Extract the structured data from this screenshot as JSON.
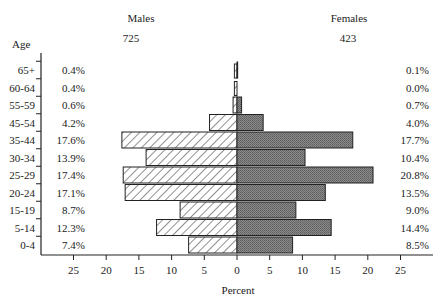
{
  "chart_data": {
    "type": "bar",
    "subtype": "population-pyramid",
    "title": "",
    "xlabel": "Percent",
    "ylabel": "Age",
    "categories": [
      "65+",
      "60-64",
      "55-59",
      "45-54",
      "35-44",
      "30-34",
      "25-29",
      "20-24",
      "15-19",
      "5-14",
      "0-4"
    ],
    "series": [
      {
        "name": "Males",
        "n": "725",
        "values": [
          0.4,
          0.4,
          0.6,
          4.2,
          17.6,
          13.9,
          17.4,
          17.1,
          8.7,
          12.3,
          7.4
        ],
        "labels": [
          "0.4%",
          "0.4%",
          "0.6%",
          "4.2%",
          "17.6%",
          "13.9%",
          "17.4%",
          "17.1%",
          "8.7%",
          "12.3%",
          "7.4%"
        ],
        "fill": "diagonal-hatch"
      },
      {
        "name": "Females",
        "n": "423",
        "values": [
          0.1,
          0.0,
          0.7,
          4.0,
          17.7,
          10.4,
          20.8,
          13.5,
          9.0,
          14.4,
          8.5
        ],
        "labels": [
          "0.1%",
          "0.0%",
          "0.7%",
          "4.0%",
          "17.7%",
          "10.4%",
          "20.8%",
          "13.5%",
          "9.0%",
          "14.4%",
          "8.5%"
        ],
        "fill": "dark-gray-stipple"
      }
    ],
    "xticks": [
      "25",
      "20",
      "15",
      "10",
      "5",
      "0",
      "5",
      "10",
      "15",
      "20",
      "25"
    ],
    "xlim": [
      -25,
      25
    ],
    "grid": false,
    "legend": "none (group labels above each side)"
  },
  "labels": {
    "males": "Males",
    "males_n": "725",
    "females": "Females",
    "females_n": "423",
    "age": "Age",
    "percent": "Percent"
  },
  "colors": {
    "male_hatch": "#333333",
    "female_fill": "#7a7a7a",
    "axis": "#222222"
  }
}
